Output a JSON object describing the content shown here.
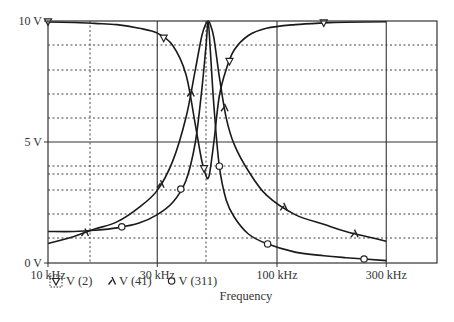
{
  "chart_data": {
    "type": "line",
    "title": "",
    "xlabel": "Frequency",
    "ylabel": "",
    "xscale": "log",
    "xlim_hz": [
      10000,
      500000
    ],
    "ylim": [
      0,
      10
    ],
    "x_ticks": [
      {
        "value": 10000,
        "label": "10 kHz"
      },
      {
        "value": 30000,
        "label": "30 kHz"
      },
      {
        "value": 100000,
        "label": "100 kHz"
      },
      {
        "value": 300000,
        "label": "300 kHz"
      }
    ],
    "y_ticks": [
      {
        "value": 0,
        "label": "0 V"
      },
      {
        "value": 5,
        "label": "5 V"
      },
      {
        "value": 10,
        "label": "10 V"
      }
    ],
    "grid": true,
    "legend_position": "bottom-left",
    "legend": [
      {
        "name": "V (2)",
        "marker": "triangle-down-boxed"
      },
      {
        "name": "V (41)",
        "marker": "lambda"
      },
      {
        "name": "V (311)",
        "marker": "circle"
      }
    ],
    "series": [
      {
        "name": "V (2)",
        "marker": "triangle-down",
        "x_khz": [
          10,
          13,
          16,
          20,
          25,
          30,
          35,
          40,
          44,
          47,
          49,
          50,
          51,
          53,
          56,
          60,
          65,
          75,
          90,
          120,
          160,
          200,
          300
        ],
        "values": [
          9.96,
          9.94,
          9.9,
          9.85,
          9.7,
          9.5,
          9.0,
          7.8,
          5.7,
          4.2,
          3.6,
          3.5,
          3.8,
          5.0,
          6.9,
          8.0,
          8.8,
          9.4,
          9.7,
          9.85,
          9.92,
          9.95,
          9.97
        ],
        "marker_points_khz": [
          10,
          32,
          48,
          62,
          160
        ]
      },
      {
        "name": "V (41)",
        "marker": "lambda",
        "x_khz": [
          10,
          13,
          16,
          20,
          25,
          30,
          35,
          40,
          44,
          47,
          49,
          50,
          51,
          53,
          56,
          60,
          65,
          75,
          90,
          120,
          160,
          200,
          300
        ],
        "values": [
          0.8,
          1.1,
          1.4,
          1.7,
          2.3,
          3.0,
          4.2,
          6.0,
          8.0,
          9.4,
          9.9,
          10.0,
          9.9,
          9.3,
          7.7,
          6.0,
          4.9,
          3.8,
          2.8,
          2.0,
          1.6,
          1.3,
          0.9
        ],
        "marker_points_khz": [
          14.5,
          31,
          42,
          59,
          107,
          218
        ]
      },
      {
        "name": "V (311)",
        "marker": "circle",
        "x_khz": [
          10,
          13,
          16,
          20,
          25,
          30,
          35,
          40,
          44,
          47,
          49,
          50,
          51,
          53,
          56,
          60,
          65,
          75,
          90,
          120,
          160,
          200,
          300
        ],
        "values": [
          1.3,
          1.3,
          1.35,
          1.45,
          1.65,
          2.0,
          2.5,
          3.4,
          5.0,
          7.2,
          9.0,
          10.0,
          9.0,
          6.5,
          4.0,
          2.6,
          1.9,
          1.2,
          0.8,
          0.45,
          0.3,
          0.22,
          0.1
        ],
        "marker_points_khz": [
          21,
          38,
          56,
          91,
          240
        ]
      }
    ]
  }
}
